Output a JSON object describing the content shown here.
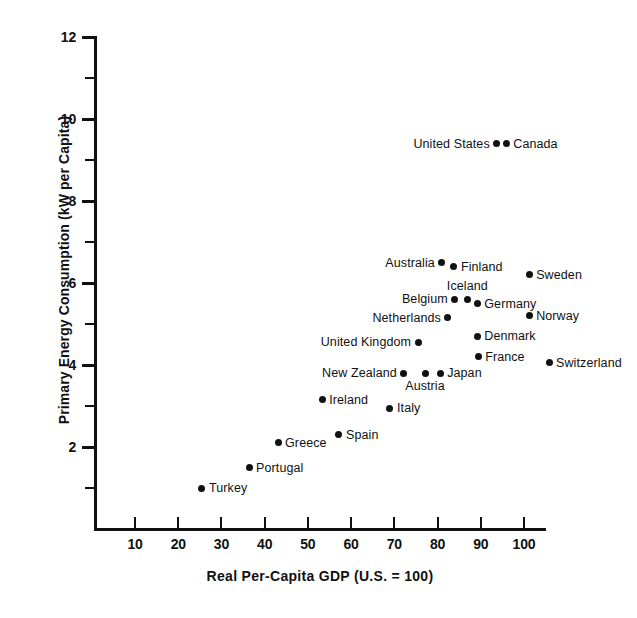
{
  "chart_data": {
    "type": "scatter",
    "title": "",
    "xlabel": "Real Per-Capita GDP (U.S.  =  100)",
    "ylabel": "Primary Energy Consumption (kW per Capita)",
    "xlim": [
      0,
      105
    ],
    "ylim": [
      0,
      12
    ],
    "grid": false,
    "legend": "none",
    "x_ticks": [
      10,
      20,
      30,
      40,
      50,
      60,
      70,
      80,
      90,
      100
    ],
    "x_tick_labels": [
      "10",
      "20",
      "30",
      "40",
      "50",
      "60",
      "70",
      "80",
      "90",
      "100"
    ],
    "y_ticks": [
      1,
      2,
      3,
      4,
      5,
      6,
      7,
      8,
      9,
      10,
      11,
      12
    ],
    "y_tick_labels": [
      "",
      "2",
      "",
      "4",
      "",
      "6",
      "",
      "8",
      "",
      "10",
      "",
      "12"
    ],
    "y_major_ticks": [
      2,
      4,
      6,
      8,
      10,
      12
    ],
    "points": [
      {
        "label": "United States",
        "x": 93.7,
        "y": 9.4,
        "label_pos": "left"
      },
      {
        "label": "Canada",
        "x": 95.9,
        "y": 9.4,
        "label_pos": "right"
      },
      {
        "label": "Australia",
        "x": 81.0,
        "y": 6.5,
        "label_pos": "left"
      },
      {
        "label": "Finland",
        "x": 83.8,
        "y": 6.4,
        "label_pos": "right"
      },
      {
        "label": "Sweden",
        "x": 101.2,
        "y": 6.2,
        "label_pos": "right"
      },
      {
        "label": "Belgium",
        "x": 84.0,
        "y": 5.6,
        "label_pos": "left"
      },
      {
        "label": "Iceland",
        "x": 86.9,
        "y": 5.6,
        "label_pos": "above"
      },
      {
        "label": "Germany",
        "x": 89.2,
        "y": 5.5,
        "label_pos": "right"
      },
      {
        "label": "Netherlands",
        "x": 82.4,
        "y": 5.15,
        "label_pos": "left"
      },
      {
        "label": "Norway",
        "x": 101.2,
        "y": 5.2,
        "label_pos": "right"
      },
      {
        "label": "Denmark",
        "x": 89.2,
        "y": 4.7,
        "label_pos": "right"
      },
      {
        "label": "United Kingdom",
        "x": 75.5,
        "y": 4.55,
        "label_pos": "left"
      },
      {
        "label": "France",
        "x": 89.4,
        "y": 4.2,
        "label_pos": "right"
      },
      {
        "label": "Switzerland",
        "x": 105.8,
        "y": 4.05,
        "label_pos": "right"
      },
      {
        "label": "New Zealand",
        "x": 72.2,
        "y": 3.8,
        "label_pos": "left"
      },
      {
        "label": "Austria",
        "x": 77.1,
        "y": 3.8,
        "label_pos": "below"
      },
      {
        "label": "Japan",
        "x": 80.6,
        "y": 3.8,
        "label_pos": "right"
      },
      {
        "label": "Ireland",
        "x": 53.3,
        "y": 3.15,
        "label_pos": "right"
      },
      {
        "label": "Italy",
        "x": 69.0,
        "y": 2.95,
        "label_pos": "right"
      },
      {
        "label": "Spain",
        "x": 57.2,
        "y": 2.3,
        "label_pos": "right"
      },
      {
        "label": "Greece",
        "x": 43.1,
        "y": 2.1,
        "label_pos": "right"
      },
      {
        "label": "Portugal",
        "x": 36.4,
        "y": 1.5,
        "label_pos": "right"
      },
      {
        "label": "Turkey",
        "x": 25.5,
        "y": 1.0,
        "label_pos": "right"
      }
    ]
  }
}
